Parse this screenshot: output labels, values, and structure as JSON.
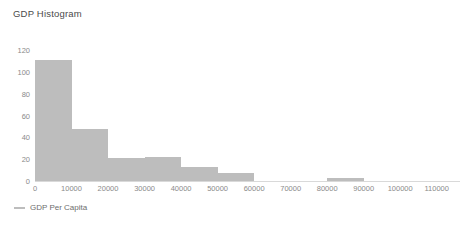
{
  "chart_data": {
    "type": "bar",
    "title": "GDP Histogram",
    "xlabel": "",
    "ylabel": "",
    "xlim": [
      0,
      115000
    ],
    "ylim": [
      0,
      120
    ],
    "grid": false,
    "legend_position": "bottom-left",
    "legend": [
      {
        "name": "GDP Per Capita",
        "marker": "line-dash",
        "color": "#bdbdbd"
      }
    ],
    "bar_color": "#bdbdbd",
    "bin_width": 10000,
    "xticks": [
      {
        "value": 0,
        "label": "0"
      },
      {
        "value": 10000,
        "label": "10000"
      },
      {
        "value": 20000,
        "label": "20000"
      },
      {
        "value": 30000,
        "label": "30000"
      },
      {
        "value": 40000,
        "label": "40000"
      },
      {
        "value": 50000,
        "label": "50000"
      },
      {
        "value": 60000,
        "label": "60000"
      },
      {
        "value": 70000,
        "label": "70000"
      },
      {
        "value": 80000,
        "label": "80000"
      },
      {
        "value": 90000,
        "label": "90000"
      },
      {
        "value": 100000,
        "label": "100000"
      },
      {
        "value": 110000,
        "label": "110000"
      }
    ],
    "yticks": [
      {
        "value": 0,
        "label": "0"
      },
      {
        "value": 20,
        "label": "20"
      },
      {
        "value": 40,
        "label": "40"
      },
      {
        "value": 60,
        "label": "60"
      },
      {
        "value": 80,
        "label": "80"
      },
      {
        "value": 100,
        "label": "100"
      },
      {
        "value": 120,
        "label": "120"
      }
    ],
    "bins": [
      {
        "x0": 0,
        "x1": 10000,
        "value": 111
      },
      {
        "x0": 10000,
        "x1": 20000,
        "value": 48
      },
      {
        "x0": 20000,
        "x1": 30000,
        "value": 21
      },
      {
        "x0": 30000,
        "x1": 40000,
        "value": 22
      },
      {
        "x0": 40000,
        "x1": 50000,
        "value": 13
      },
      {
        "x0": 50000,
        "x1": 60000,
        "value": 7
      },
      {
        "x0": 60000,
        "x1": 70000,
        "value": 0
      },
      {
        "x0": 70000,
        "x1": 80000,
        "value": 0
      },
      {
        "x0": 80000,
        "x1": 90000,
        "value": 3
      },
      {
        "x0": 90000,
        "x1": 100000,
        "value": 0
      },
      {
        "x0": 100000,
        "x1": 110000,
        "value": 0
      }
    ]
  }
}
